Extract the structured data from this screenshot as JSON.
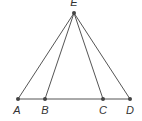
{
  "diagram": {
    "type": "geometry-triangle-cevians",
    "colors": {
      "line": "#555555",
      "point": "#444444",
      "label": "#333333"
    },
    "points": [
      {
        "id": "E",
        "label": "E",
        "x": 74,
        "y": 13,
        "lx": 74,
        "ly": 6,
        "anchor": "middle"
      },
      {
        "id": "A",
        "label": "A",
        "x": 18,
        "y": 99,
        "lx": 17,
        "ly": 114,
        "anchor": "middle"
      },
      {
        "id": "B",
        "label": "B",
        "x": 45,
        "y": 99,
        "lx": 45,
        "ly": 114,
        "anchor": "middle"
      },
      {
        "id": "C",
        "label": "C",
        "x": 103,
        "y": 99,
        "lx": 103,
        "ly": 114,
        "anchor": "middle"
      },
      {
        "id": "D",
        "label": "D",
        "x": 130,
        "y": 99,
        "lx": 130,
        "ly": 114,
        "anchor": "middle"
      }
    ],
    "segments": [
      [
        "A",
        "D"
      ],
      [
        "E",
        "A"
      ],
      [
        "E",
        "B"
      ],
      [
        "E",
        "C"
      ],
      [
        "E",
        "D"
      ]
    ]
  }
}
